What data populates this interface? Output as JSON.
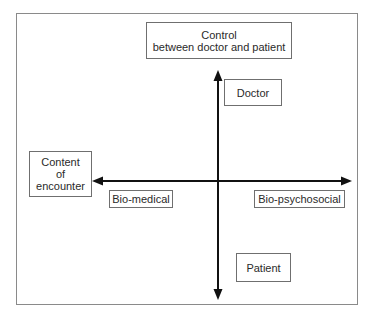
{
  "diagram": {
    "title_box": {
      "line1": "Control",
      "line2": "between doctor and patient"
    },
    "vertical_axis": {
      "top_label": "Doctor",
      "bottom_label": "Patient"
    },
    "content_box": {
      "line1": "Content",
      "line2": "of",
      "line3": "encounter"
    },
    "horizontal_axis": {
      "left_label": "Bio-medical",
      "right_label": "Bio-psychosocial"
    },
    "colors": {
      "axis": "#111111",
      "box_border": "#6f6f6f",
      "frame_border": "#8a8a8a",
      "text": "#2a2a2a"
    }
  }
}
